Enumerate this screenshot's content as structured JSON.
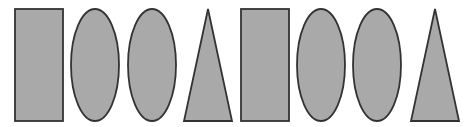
{
  "colors": {
    "background": "#ffffff",
    "fill": "#a9a9a9",
    "stroke": "#333333"
  },
  "shapes": [
    {
      "type": "rectangle",
      "name": "rectangle-1",
      "x": 15,
      "y": 9,
      "w": 48,
      "h": 112
    },
    {
      "type": "ellipse",
      "name": "ellipse-1",
      "cx": 95,
      "cy": 65,
      "rx": 24,
      "ry": 56
    },
    {
      "type": "ellipse",
      "name": "ellipse-2",
      "cx": 152,
      "cy": 65,
      "rx": 24,
      "ry": 56
    },
    {
      "type": "triangle",
      "name": "triangle-1",
      "points": [
        [
          208,
          9
        ],
        [
          232,
          121
        ],
        [
          184,
          121
        ]
      ]
    },
    {
      "type": "rectangle",
      "name": "rectangle-2",
      "x": 241,
      "y": 9,
      "w": 48,
      "h": 112
    },
    {
      "type": "ellipse",
      "name": "ellipse-3",
      "cx": 321,
      "cy": 65,
      "rx": 24,
      "ry": 56
    },
    {
      "type": "ellipse",
      "name": "ellipse-4",
      "cx": 377,
      "cy": 65,
      "rx": 24,
      "ry": 56
    },
    {
      "type": "triangle",
      "name": "triangle-2",
      "points": [
        [
          435,
          9
        ],
        [
          459,
          121
        ],
        [
          411,
          121
        ]
      ]
    }
  ]
}
